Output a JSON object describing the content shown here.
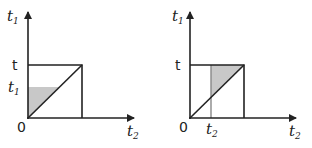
{
  "diagrams": [
    {
      "y_axis_label": "t",
      "y_axis_sub": "1",
      "x_axis_label": "t",
      "x_axis_sub": "2",
      "top_label": "t",
      "mid_label": "t",
      "mid_sub": "1",
      "origin_label": "0"
    },
    {
      "y_axis_label": "t",
      "y_axis_sub": "1",
      "x_axis_label": "t",
      "x_axis_sub": "2",
      "top_label": "t",
      "mid_label": "t",
      "mid_sub": "2",
      "origin_label": "0"
    }
  ],
  "colors": {
    "line": "#222222",
    "shade": "#c8c8c8"
  }
}
